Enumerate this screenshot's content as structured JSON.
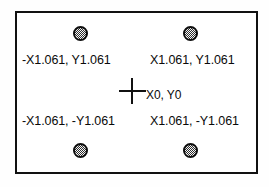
{
  "diagram": {
    "frame": {
      "name": "bounding-rectangle",
      "border_color": "#111111",
      "fill_color": "#ffffff"
    },
    "origin": {
      "marker": "crosshair",
      "label": "X0, Y0",
      "x": 0,
      "y": 0
    },
    "points": [
      {
        "id": "top-left",
        "label": "-X1.061, Y1.061",
        "x": -1.061,
        "y": 1.061,
        "marker": "hatched-circle"
      },
      {
        "id": "top-right",
        "label": "X1.061, Y1.061",
        "x": 1.061,
        "y": 1.061,
        "marker": "hatched-circle"
      },
      {
        "id": "bottom-left",
        "label": "-X1.061, -Y1.061",
        "x": -1.061,
        "y": -1.061,
        "marker": "hatched-circle"
      },
      {
        "id": "bottom-right",
        "label": "X1.061, -Y1.061",
        "x": 1.061,
        "y": -1.061,
        "marker": "hatched-circle"
      }
    ],
    "colors": {
      "line": "#111111",
      "marker_fill": "#b9b9b9",
      "marker_stroke": "#0d0d0d",
      "text": "#0a0a0a",
      "background": "#ffffff"
    }
  }
}
